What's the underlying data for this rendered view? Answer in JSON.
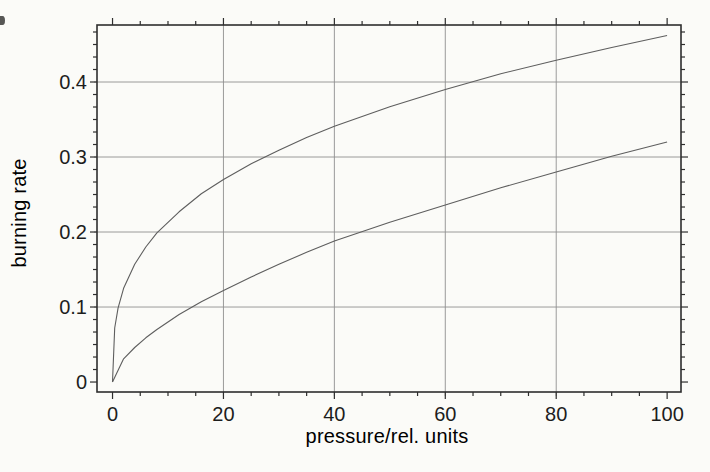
{
  "style": {
    "background": "#fbfbf8",
    "frame_color": "#2e2e2e",
    "grid_color": "#8f8f8f",
    "curve_color": "#5e5e5e",
    "text_color": "#1d1d1d"
  },
  "chart_data": {
    "type": "line",
    "title": "",
    "xlabel": "pressure/rel. units",
    "ylabel": "burning rate",
    "xlim": [
      -2.8,
      102.5
    ],
    "ylim": [
      -0.0133,
      0.476
    ],
    "x_ticks": [
      0,
      20,
      40,
      60,
      80,
      100
    ],
    "x_tick_labels": [
      "0",
      "20",
      "40",
      "60",
      "80",
      "100"
    ],
    "y_ticks": [
      0,
      0.1,
      0.2,
      0.3,
      0.4
    ],
    "y_tick_labels": [
      "0",
      "0.1",
      "0.2",
      "0.3",
      "0.4"
    ],
    "x_minor_step": 5,
    "x_major_step": 20,
    "y_minor_step": 0.0166667,
    "y_major_step": 0.1,
    "grid": true,
    "grid_x": [
      20,
      40,
      60,
      80
    ],
    "grid_y": [
      0.1,
      0.2,
      0.3,
      0.4
    ],
    "legend": "none",
    "series": [
      {
        "id": "upper-curve",
        "points": [
          [
            0,
            0
          ],
          [
            0.4,
            0.072
          ],
          [
            1,
            0.099
          ],
          [
            2,
            0.125
          ],
          [
            4,
            0.157
          ],
          [
            6,
            0.18
          ],
          [
            8,
            0.199
          ],
          [
            12,
            0.227
          ],
          [
            16,
            0.251
          ],
          [
            20,
            0.27
          ],
          [
            25,
            0.291
          ],
          [
            30,
            0.309
          ],
          [
            35,
            0.326
          ],
          [
            40,
            0.341
          ],
          [
            50,
            0.367
          ],
          [
            60,
            0.39
          ],
          [
            70,
            0.411
          ],
          [
            80,
            0.429
          ],
          [
            90,
            0.446
          ],
          [
            100,
            0.462
          ]
        ]
      },
      {
        "id": "lower-curve",
        "points": [
          [
            0,
            0
          ],
          [
            2,
            0.031
          ],
          [
            4,
            0.046
          ],
          [
            6,
            0.059
          ],
          [
            8,
            0.07
          ],
          [
            12,
            0.09
          ],
          [
            16,
            0.107
          ],
          [
            20,
            0.122
          ],
          [
            25,
            0.14
          ],
          [
            30,
            0.157
          ],
          [
            35,
            0.173
          ],
          [
            40,
            0.188
          ],
          [
            50,
            0.213
          ],
          [
            60,
            0.236
          ],
          [
            70,
            0.259
          ],
          [
            80,
            0.28
          ],
          [
            90,
            0.301
          ],
          [
            100,
            0.32
          ]
        ]
      }
    ]
  }
}
